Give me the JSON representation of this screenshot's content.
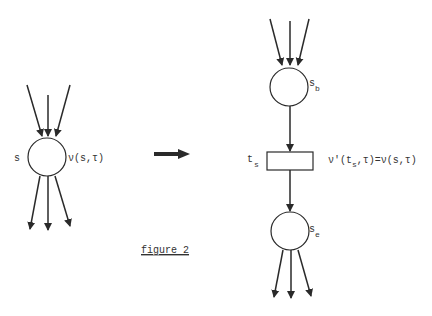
{
  "colors": {
    "ink": "#2a2a2a",
    "background": "#ffffff"
  },
  "left": {
    "node": {
      "label": "s",
      "annotation": "ν(s,τ)"
    }
  },
  "transform_arrow": {
    "meaning": "transforms-into"
  },
  "right": {
    "begin_node": {
      "label": "s",
      "subscript": "b"
    },
    "transition": {
      "label": "t",
      "subscript": "s",
      "annotation_pre": "ν'(t",
      "annotation_sub": "s",
      "annotation_post": ",τ)=ν(s,τ)"
    },
    "end_node": {
      "label": "s",
      "subscript": "e"
    }
  },
  "caption": "figure 2"
}
